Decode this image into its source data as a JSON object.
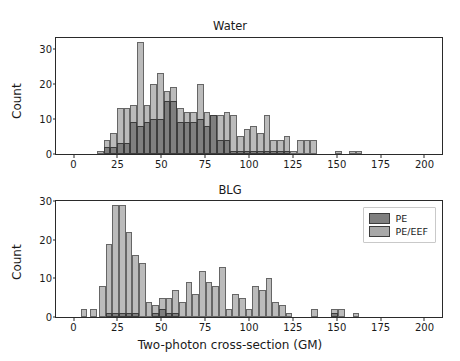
{
  "figure": {
    "xlabel": "Two-photon cross-section (GM)",
    "panels": [
      {
        "key": "water",
        "title": "Water",
        "ylabel": "Count"
      },
      {
        "key": "blg",
        "title": "BLG",
        "ylabel": "Count"
      }
    ]
  },
  "legend": {
    "position": "upper right",
    "entries": [
      {
        "label": "PE",
        "color": "#7f7f7f"
      },
      {
        "label": "PE/EEF",
        "color": "#a8a8a8"
      }
    ]
  },
  "chart_data": [
    {
      "type": "bar",
      "title": "Water",
      "xlabel": "",
      "ylabel": "Count",
      "xlim": [
        -10,
        210
      ],
      "ylim": [
        0,
        33
      ],
      "xticks": [
        0,
        25,
        50,
        75,
        100,
        125,
        150,
        175,
        200
      ],
      "yticks": [
        0,
        10,
        20,
        30
      ],
      "grid": false,
      "bin_width": 3.8,
      "bin_left_edges": [
        13.3,
        17.1,
        20.9,
        24.7,
        28.5,
        32.3,
        36.1,
        39.9,
        43.7,
        47.5,
        51.3,
        55.1,
        58.9,
        62.7,
        66.5,
        70.3,
        74.1,
        77.9,
        81.7,
        85.5,
        89.3,
        93.1,
        96.9,
        100.7,
        104.5,
        108.3,
        112.1,
        115.9,
        119.7,
        123.5,
        127.3,
        131.1,
        134.9,
        149.0,
        157.0,
        160.8
      ],
      "series": [
        {
          "name": "PE",
          "color": "#7f7f7f",
          "values": [
            0,
            2,
            2,
            3,
            3,
            9,
            8,
            9,
            10,
            10,
            15,
            15,
            9,
            9,
            9,
            10,
            8,
            11,
            4,
            4,
            1,
            1,
            1,
            1,
            1,
            1,
            1,
            1,
            1,
            0,
            0,
            0,
            0,
            0,
            0,
            0
          ]
        },
        {
          "name": "PE/EEF",
          "color": "#a8a8a8",
          "values": [
            1,
            4,
            6,
            13,
            13,
            14,
            32,
            14,
            20,
            23,
            18,
            19,
            13,
            12,
            12,
            20,
            12,
            11,
            11,
            12,
            11,
            5,
            7,
            8,
            6,
            11,
            4,
            4,
            5,
            1,
            4,
            4,
            4,
            1,
            1,
            1
          ]
        }
      ]
    },
    {
      "type": "bar",
      "title": "BLG",
      "xlabel": "Two-photon cross-section (GM)",
      "ylabel": "Count",
      "xlim": [
        -10,
        210
      ],
      "ylim": [
        0,
        30
      ],
      "xticks": [
        0,
        25,
        50,
        75,
        100,
        125,
        150,
        175,
        200
      ],
      "yticks": [
        0,
        10,
        20,
        30
      ],
      "grid": false,
      "bin_width": 3.8,
      "bin_left_edges": [
        4.0,
        9.5,
        14.5,
        18.3,
        22.1,
        25.9,
        29.7,
        33.5,
        37.3,
        41.1,
        44.9,
        48.7,
        52.5,
        56.3,
        60.1,
        63.9,
        67.7,
        71.5,
        75.3,
        79.1,
        82.9,
        86.7,
        90.5,
        94.3,
        98.1,
        101.9,
        105.7,
        109.5,
        113.3,
        117.1,
        120.9,
        124.7,
        135.5,
        147.0,
        151.0,
        159.0
      ],
      "series": [
        {
          "name": "PE",
          "color": "#7f7f7f",
          "values": [
            0,
            0,
            0,
            1,
            1,
            1,
            1,
            1,
            0,
            0,
            1,
            2,
            1,
            1,
            0,
            0,
            0,
            0,
            0,
            0,
            0,
            0,
            0,
            0,
            0,
            0,
            0,
            0,
            0,
            0,
            0,
            0,
            0,
            1,
            0,
            0
          ]
        },
        {
          "name": "PE/EEF",
          "color": "#a8a8a8",
          "values": [
            2,
            2,
            8,
            19,
            29,
            29,
            22,
            16,
            14,
            4,
            3,
            5,
            5,
            7,
            4,
            9,
            6,
            12,
            9,
            8,
            13,
            2,
            6,
            5,
            2,
            8,
            7,
            10,
            4,
            3,
            1,
            0,
            2,
            2,
            2,
            1
          ]
        }
      ]
    }
  ]
}
